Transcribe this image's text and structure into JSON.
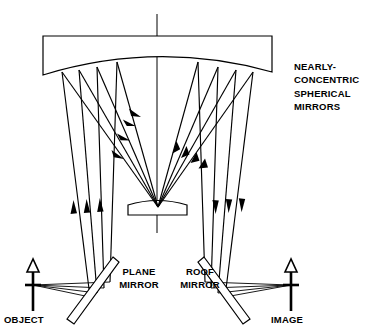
{
  "figure": {
    "background_color": "#ffffff",
    "line_color": "#000000"
  },
  "labels": {
    "mirrors_caption": "NEARLY-\nCONCENTRIC\nSPHERICAL\nMIRRORS",
    "plane_mirror": "PLANE\nMIRROR",
    "roof_mirror": "ROOF\nMIRROR",
    "object": "OBJECT",
    "image": "IMAGE"
  },
  "components": [
    {
      "name": "large-spherical-mirror",
      "kind": "curved-mirror",
      "description": "Large nearly-concentric spherical mirror at top, flat top edge with convex lower reflecting surface",
      "left": 43,
      "right": 272,
      "top": 36,
      "bottom": 75
    },
    {
      "name": "small-spherical-mirror",
      "kind": "curved-mirror",
      "description": "Small secondary spherical mirror element at center bottom of mirror cavity",
      "left": 127,
      "right": 188,
      "top": 199,
      "bottom": 215
    },
    {
      "name": "plane-mirror",
      "kind": "flat-fold-mirror",
      "description": "Tilted plane fold mirror on object side",
      "tilt_degrees": -56
    },
    {
      "name": "roof-mirror",
      "kind": "roof-fold-mirror",
      "description": "Tilted roof fold mirror on image side",
      "tilt_degrees": 56
    },
    {
      "name": "object-arrow",
      "kind": "object",
      "description": "Upward open arrow marking the object plane",
      "x": 33,
      "tip_y": 261,
      "base_y": 311
    },
    {
      "name": "image-arrow",
      "kind": "image",
      "description": "Upward open arrow marking the image plane",
      "x": 291,
      "tip_y": 261,
      "base_y": 311
    },
    {
      "name": "optical-axis",
      "kind": "axis",
      "description": "Vertical optical axis through the center of the system",
      "x": 157,
      "top_y": 14,
      "bottom_y": 233
    }
  ],
  "ray_bundles": [
    {
      "name": "object-to-plane-mirror",
      "direction": "horizontal-right",
      "count": 3,
      "description": "Rays leaving object arrow base toward the tilted plane mirror"
    },
    {
      "name": "plane-mirror-to-large-mirror",
      "direction": "upward",
      "count": 3,
      "description": "Near-vertical rays folded upward to the large spherical mirror, arrowheads pointing up"
    },
    {
      "name": "large-mirror-to-small-mirror",
      "direction": "down-right-diagonal",
      "count": 3,
      "description": "Diagonal rays converging from left of large mirror down onto small mirror, arrowheads pointing down-right"
    },
    {
      "name": "small-mirror-to-large-mirror",
      "direction": "up-right-diagonal",
      "count": 3,
      "description": "Diagonal rays diverging from small mirror up to right of large mirror, arrowheads pointing up-right"
    },
    {
      "name": "large-mirror-to-roof-mirror",
      "direction": "downward",
      "count": 3,
      "description": "Near-vertical rays going down from right of large mirror to roof mirror, arrowheads pointing down"
    },
    {
      "name": "roof-mirror-to-image",
      "direction": "horizontal-right",
      "count": 3,
      "description": "Rays folded from roof mirror toward the image arrow base"
    }
  ]
}
